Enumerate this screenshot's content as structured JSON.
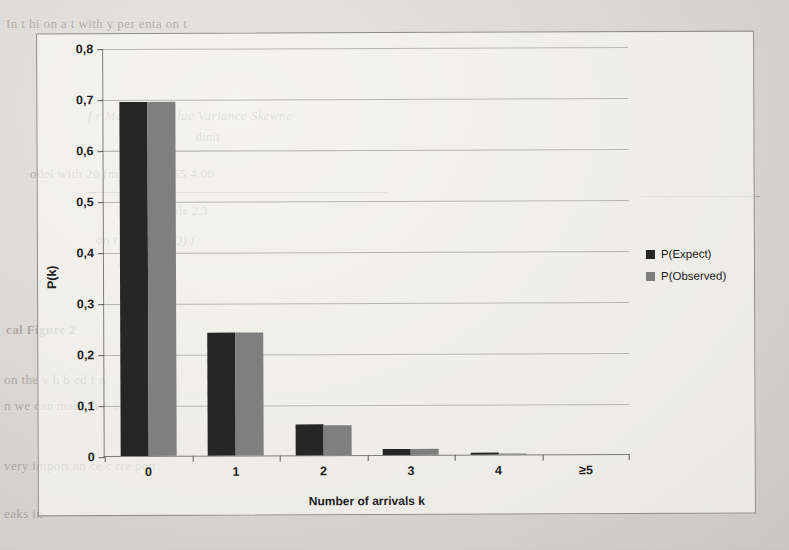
{
  "chart_data": {
    "type": "bar",
    "title": "",
    "subtitle": "",
    "xlabel": "Number of arrivals k",
    "ylabel": "P(k)",
    "categories": [
      "0",
      "1",
      "2",
      "3",
      "4",
      "≥5"
    ],
    "series": [
      {
        "name": "P(Expect)",
        "color": "#262626",
        "values": [
          0.695,
          0.241,
          0.06,
          0.012,
          0.003,
          0.0
        ]
      },
      {
        "name": "P(Observed)",
        "color": "#7f7f7f",
        "values": [
          0.694,
          0.241,
          0.059,
          0.011,
          0.002,
          0.0
        ]
      }
    ],
    "ylim": [
      0,
      0.8
    ],
    "ytick_values": [
      0,
      0.1,
      0.2,
      0.3,
      0.4,
      0.5,
      0.6,
      0.7,
      0.8
    ],
    "ytick_labels": [
      "0",
      "0,1",
      "0,2",
      "0,3",
      "0,4",
      "0,5",
      "0,6",
      "0,7",
      "0,8"
    ],
    "grid": "horizontal",
    "legend_position": "right",
    "decimal_separator": "comma"
  },
  "legend": {
    "entries": [
      {
        "label": "P(Expect)"
      },
      {
        "label": "P(Observed)"
      }
    ]
  },
  "page_background": {
    "lines": [
      {
        "text": "In t   hi   on   a  t      with     y     per  enta    on t"
      },
      {
        "text": "f   r   Maximum      Value     Variance     Skewne"
      },
      {
        "text": "dinit"
      },
      {
        "text": "odel with 20 (m)     0.194        1.55        4.00"
      },
      {
        "text": "Table 2.3"
      },
      {
        "text": "on  t     v    ue    fo      ℓ(Q)   f"
      },
      {
        "text": "cal Figure 2"
      },
      {
        "text": "on  the      v      h     b        ed     f    n"
      },
      {
        "text": "n   we  can     mate   th      F    a   t  rd"
      },
      {
        "text": "very     import   an     ce    c    rre   pon"
      },
      {
        "text": "eaks in"
      }
    ]
  }
}
